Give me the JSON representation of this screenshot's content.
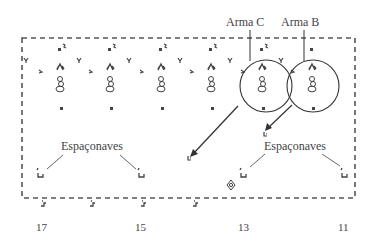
{
  "labels": {
    "weapon_c": "Arma C",
    "weapon_b": "Arma B",
    "spaceships_left": "Espaçonaves",
    "spaceships_right": "Espaçonaves"
  },
  "x_axis": {
    "ticks": [
      "17",
      "15",
      "13",
      "11"
    ]
  },
  "colors": {
    "cells": "#444444",
    "border": "#555555",
    "lines": "#333333",
    "background": "#ffffff"
  }
}
